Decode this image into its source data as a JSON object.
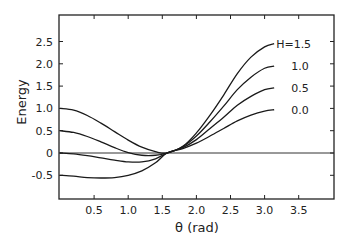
{
  "chart_data": {
    "type": "line",
    "title": "",
    "xlabel": "θ (rad)",
    "ylabel": "Energy",
    "xlim": [
      0,
      4.0
    ],
    "ylim": [
      -0.9,
      3.0
    ],
    "grid": false,
    "x_ticks": [
      "0.5",
      "1.0",
      "1.5",
      "2.0",
      "2.5",
      "3.0",
      "3.5"
    ],
    "y_ticks": [
      "2.5",
      "2.0",
      "1.5",
      "1.0",
      "0.5",
      "0",
      "-0.5"
    ],
    "reference_line": {
      "y": 0
    },
    "x": [
      0,
      0.2,
      0.4,
      0.6,
      0.8,
      1.0,
      1.2,
      1.4,
      1.57,
      1.8,
      2.0,
      2.2,
      2.4,
      2.6,
      2.8,
      3.0,
      3.14
    ],
    "series": [
      {
        "name": "H=1.5",
        "label": "H=1.5",
        "values": [
          1.0,
          0.96,
          0.84,
          0.67,
          0.48,
          0.29,
          0.13,
          0.03,
          0.0,
          0.15,
          0.45,
          0.85,
          1.3,
          1.78,
          2.15,
          2.38,
          2.45
        ]
      },
      {
        "name": "H=1.0",
        "label": "1.0",
        "values": [
          0.5,
          0.46,
          0.37,
          0.25,
          0.12,
          0.01,
          -0.05,
          -0.05,
          0.0,
          0.14,
          0.38,
          0.7,
          1.05,
          1.42,
          1.7,
          1.9,
          1.95
        ]
      },
      {
        "name": "H=0.5",
        "label": "0.5",
        "values": [
          0.0,
          -0.02,
          -0.06,
          -0.11,
          -0.16,
          -0.2,
          -0.2,
          -0.13,
          0.0,
          0.12,
          0.3,
          0.55,
          0.8,
          1.07,
          1.27,
          1.42,
          1.46
        ]
      },
      {
        "name": "H=0.0",
        "label": "0.0",
        "values": [
          -0.5,
          -0.52,
          -0.55,
          -0.56,
          -0.55,
          -0.5,
          -0.4,
          -0.22,
          0.0,
          0.1,
          0.22,
          0.38,
          0.55,
          0.72,
          0.85,
          0.94,
          0.97
        ]
      }
    ]
  }
}
